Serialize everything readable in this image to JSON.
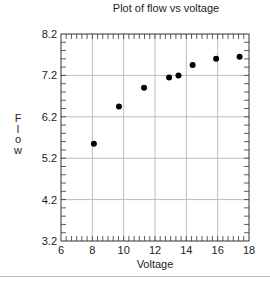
{
  "chart_data": {
    "type": "scatter",
    "title": "Plot of flow vs voltage",
    "xlabel": "Voltage",
    "ylabel": "Flow",
    "xlim": [
      6,
      18
    ],
    "ylim": [
      3.2,
      8.2
    ],
    "xticks": [
      6,
      8,
      10,
      12,
      14,
      16,
      18
    ],
    "xtick_labels": [
      "6",
      "8",
      "10",
      "12",
      "14",
      "16",
      "18"
    ],
    "yticks": [
      3.2,
      4.2,
      5.2,
      6.2,
      7.2,
      8.2
    ],
    "ytick_labels": [
      "3.2",
      "4.2",
      "5.2",
      "6.2",
      "7.2",
      "8.2"
    ],
    "x_minor_step": 0.3333,
    "y_minor_step": 0.2,
    "grid": true,
    "legend": null,
    "series": [
      {
        "name": "flow",
        "marker": "circle",
        "color": "#000000",
        "x": [
          8.1,
          9.7,
          11.3,
          12.9,
          13.5,
          14.4,
          15.9,
          17.4
        ],
        "y": [
          5.55,
          6.45,
          6.9,
          7.15,
          7.2,
          7.45,
          7.6,
          7.65
        ]
      }
    ]
  },
  "colors": {
    "grid": "#bdbdbd",
    "axis": "#333333",
    "marker": "#000000",
    "rule": "#b8b8b8"
  }
}
